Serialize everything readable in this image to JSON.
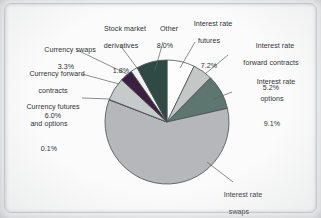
{
  "chart_data": {
    "type": "pie",
    "title": "",
    "subtitle": "",
    "xlabel": "",
    "ylabel": "",
    "units": "percent",
    "legend_position": "none",
    "grid": false,
    "labels_inline": true,
    "start_angle_deg": 0,
    "direction": "clockwise",
    "categories": [
      "Interest rate futures",
      "Interest rate forward contracts",
      "Interest rate options",
      "Interest rate swaps",
      "Currency futures and options",
      "Currency forward contracts",
      "Currency swaps",
      "Stock market derivatives",
      "Other"
    ],
    "values": [
      7.2,
      5.2,
      9.1,
      59.4,
      0.1,
      6.0,
      3.3,
      1.8,
      8.0
    ],
    "colors": [
      "#fdfdfd",
      "#c3c7c6",
      "#5e7670",
      "#b5b7bb",
      "#e6e7e8",
      "#c7cacb",
      "#3d1f42",
      "#f0f1f1",
      "#2f4a45"
    ],
    "slices": [
      {
        "label": "Interest rate futures",
        "value": 7.2,
        "value_text": "7.2%",
        "color": "#fdfdfd"
      },
      {
        "label": "Interest rate forward contracts",
        "value": 5.2,
        "value_text": "5.2%",
        "color": "#c3c7c6"
      },
      {
        "label": "Interest rate options",
        "value": 9.1,
        "value_text": "9.1%",
        "color": "#5e7670"
      },
      {
        "label": "Interest rate swaps",
        "value": 59.4,
        "value_text": "59.4%",
        "color": "#b5b7bb"
      },
      {
        "label": "Currency futures and options",
        "value": 0.1,
        "value_text": "0.1%",
        "color": "#e6e7e8"
      },
      {
        "label": "Currency forward contracts",
        "value": 6.0,
        "value_text": "6.0%",
        "color": "#c7cacb"
      },
      {
        "label": "Currency swaps",
        "value": 3.3,
        "value_text": "3.3%",
        "color": "#3d1f42"
      },
      {
        "label": "Stock market derivatives",
        "value": 1.8,
        "value_text": "1.8%",
        "color": "#f0f1f1"
      },
      {
        "label": "Other",
        "value": 8.0,
        "value_text": "8.0%",
        "color": "#2f4a45"
      }
    ]
  },
  "annotations": {
    "stock_market_derivatives": {
      "line1": "Stock market",
      "line2": "derivatives",
      "pct": "1.8%"
    },
    "other": {
      "line1": "Other",
      "line2": "",
      "pct": "8.0%"
    },
    "interest_rate_futures": {
      "line1": "Interest rate",
      "line2": "futures",
      "pct": "7.2%"
    },
    "interest_rate_forward": {
      "line1": "Interest rate",
      "line2": "forward contracts",
      "pct": "5.2%"
    },
    "interest_rate_options": {
      "line1": "Interest rate",
      "line2": "options",
      "pct": "9.1%"
    },
    "interest_rate_swaps": {
      "line1": "Interest rate",
      "line2": "swaps",
      "pct": "59.4%"
    },
    "currency_swaps": {
      "line1": "Currency swaps",
      "line2": "",
      "pct": "3.3%"
    },
    "currency_forward": {
      "line1": "Currency forward",
      "line2": "contracts",
      "pct": "6.0%"
    },
    "currency_futures_options": {
      "line1": "Currency futures",
      "line2": "and options",
      "pct": "0.1%"
    }
  },
  "style": {
    "outline_color": "#4a4f52",
    "text_color": "#2e3234",
    "page_background": "#fbfbfb"
  }
}
